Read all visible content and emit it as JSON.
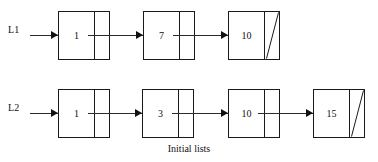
{
  "figure": {
    "caption": "Initial lists",
    "background_color": "#ffffff",
    "stroke_color": "#1a1a1a",
    "text_color": "#111111"
  },
  "lists": [
    {
      "label": "L1",
      "nodes": [
        {
          "value": "1",
          "next": "pointer"
        },
        {
          "value": "7",
          "next": "pointer"
        },
        {
          "value": "10",
          "next": "null"
        }
      ]
    },
    {
      "label": "L2",
      "nodes": [
        {
          "value": "1",
          "next": "pointer"
        },
        {
          "value": "3",
          "next": "pointer"
        },
        {
          "value": "10",
          "next": "pointer"
        },
        {
          "value": "15",
          "next": "null"
        }
      ]
    }
  ]
}
